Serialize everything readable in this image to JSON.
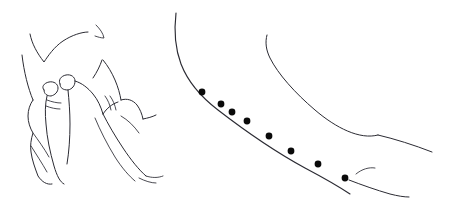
{
  "figure": {
    "domain_kind": "line-art anatomical illustration",
    "width": 457,
    "height": 207,
    "background_color": "#ffffff",
    "ink_color": "#2b2b33",
    "marker_color": "#0a0a0a",
    "title": "",
    "subtitle": "",
    "caption": "",
    "panel_labels": [],
    "annotations": []
  },
  "panels": [
    {
      "id": "left-panel",
      "name": "pinching-fingers-illustration",
      "label": "",
      "description": "Hand with thumb and index finger pinching a small fold of skin",
      "bounds": {
        "x": 10,
        "y": 20,
        "width": 160,
        "height": 165
      }
    },
    {
      "id": "right-panel",
      "name": "limb-contour-with-markers",
      "label": "",
      "description": "Limb contour with eight marked injection or measurement points along the upper edge",
      "bounds": {
        "x": 170,
        "y": 8,
        "width": 280,
        "height": 195
      }
    }
  ],
  "chart_data": {
    "type": "scatter",
    "title": "",
    "xlabel": "",
    "ylabel": "",
    "xlim": [
      0,
      457
    ],
    "ylim": [
      0,
      207
    ],
    "grid": false,
    "legend": "none",
    "series": [
      {
        "name": "marked-points",
        "marker": "filled-circle",
        "marker_radius": 3.4,
        "color": "#0a0a0a",
        "count": 8,
        "points": [
          {
            "index": 1,
            "x": 202,
            "y": 92
          },
          {
            "index": 2,
            "x": 221,
            "y": 104
          },
          {
            "index": 3,
            "x": 247,
            "y": 121
          },
          {
            "index": 4,
            "x": 269,
            "y": 136
          },
          {
            "index": 5,
            "x": 291,
            "y": 151
          },
          {
            "index": 6,
            "x": 318,
            "y": 164
          },
          {
            "index": 7,
            "x": 345,
            "y": 178
          },
          {
            "index": 8,
            "x": 232,
            "y": 112
          }
        ]
      }
    ],
    "paths": [
      {
        "name": "marker-guide-curve",
        "description": "Upper limb contour along which markers are placed",
        "color": "#2b2b33"
      },
      {
        "name": "secondary-limb-contour",
        "description": "Inner limb edge descending to a junction",
        "color": "#2b2b33"
      },
      {
        "name": "lower-limb-contour",
        "description": "Lower limb edge sweeping to the right",
        "color": "#2b2b33"
      }
    ]
  },
  "strokes": {
    "left_panel": {
      "upper_contour": "M30,34 C32,44 37,53 44,62 C48,56 54,47 63,41 C72,35 82,32 88,32",
      "upper_tick": "M96,25 C100,29 103,33 104,38 C101,38 98,37 95,36",
      "long_arm_edge": "M22,55 C24,72 28,88 33,100",
      "thumb_outline": "M33,100 C30,104 28,110 28,116 C28,122 30,128 33,133 C31,139 30,146 31,152 C32,160 35,168 38,176 C42,182 47,185 52,184",
      "index_fingertip": "M44,90 C41,87 44,83 49,82 C54,81 58,84 58,88 C58,92 55,95 51,96 C47,96 44,94 44,90",
      "thumb_fingertip": "M60,84 C58,80 61,76 66,75 C71,74 75,77 75,81 C75,86 72,89 68,90 C63,90 60,88 60,84",
      "finger_body_left": "M47,96 C45,104 45,114 46,124 C47,138 50,152 54,166 C57,176 60,182 64,184",
      "finger_body_right": "M68,90 C69,100 70,112 70,124 C70,138 69,152 67,164",
      "crease_1": "M47,100 C52,102 57,103 61,103",
      "crease_2": "M46,106 C51,108 56,109 60,109",
      "skin_fold": "M75,81 C82,83 88,88 93,94 C98,100 101,107 103,114",
      "knuckle_ridge": "M93,78 C97,72 100,66 102,60",
      "hand_top_right": "M103,60 C108,66 112,73 115,80 C118,87 120,94 121,100",
      "middle_valley": "M103,114 C107,108 112,104 118,102",
      "right_hand_edge": "M121,100 C127,98 133,100 137,105 C140,109 142,114 143,119",
      "right_wrist": "M143,119 C148,118 152,117 156,115",
      "inner_fold_a": "M105,96 C108,100 110,105 111,110",
      "inner_fold_b": "M110,96 C113,100 115,105 116,110",
      "palm_sweep": "M103,114 C108,124 115,136 123,148 C131,160 139,170 146,176",
      "palm_sweep_b": "M95,118 C100,130 107,144 115,157 C122,168 129,176 135,181",
      "lower_finger_a": "M33,133 C38,140 44,148 49,157",
      "lower_finger_b": "M31,146 C36,154 42,163 47,172",
      "tip_flick_a": "M146,176 C152,178 158,178 163,176",
      "tip_flick_b": "M139,178 C145,181 151,183 156,183",
      "cuff_curve": "M121,116 C128,120 134,126 139,133"
    },
    "right_panel": {
      "marker_guide": "M176,13 C174,30 175,48 181,64 C188,82 201,97 218,110 C240,127 272,150 305,168 C322,177 338,186 350,194",
      "secondary_contour": "M267,35 C265,42 266,50 270,58 C278,74 295,93 315,110 C336,128 360,140 378,135",
      "junction_line": "M378,135 C395,139 414,145 432,152",
      "lower_contour": "M349,180 C362,185 376,190 390,194 C398,196 404,197 409,197",
      "detached_arc": "M356,174 C362,169 369,167 375,168"
    }
  }
}
